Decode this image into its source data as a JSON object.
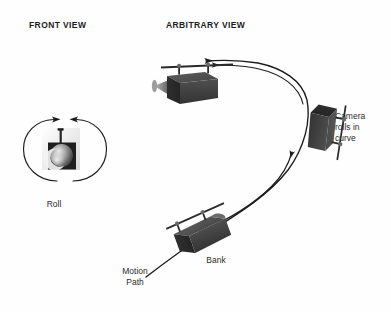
{
  "diagram": {
    "title_front": "FRONT VIEW",
    "title_arbitrary": "ARBITRARY VIEW",
    "background_color": "#fefefe",
    "ink_color": "#1c1c1c",
    "body_color": "#4a4a4a",
    "body_shade_dark": "#2e2e2e",
    "body_shade_mid": "#3a3a3a",
    "lens_color": "#8f8f8f"
  },
  "front_view": {
    "heading": "FRONT VIEW",
    "label_roll": "Roll",
    "rotation_indicator": "circular-rotation-arrows"
  },
  "arbitrary_view": {
    "heading": "ARBITRARY VIEW",
    "label_bank": "Bank",
    "label_motion_path": "Motion\nPath",
    "label_camera_rolls": "Camera\nrolls in\ncurve"
  }
}
